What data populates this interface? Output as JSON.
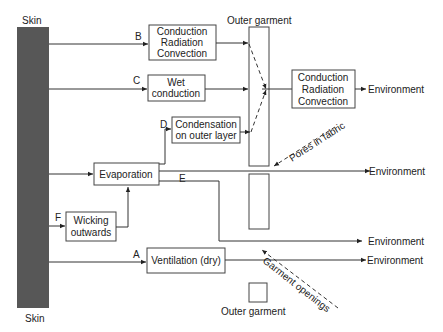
{
  "labels": {
    "skin_top": "Skin",
    "skin_bottom": "Skin",
    "outer_garment_top": "Outer garment",
    "outer_garment_bottom": "Outer garment",
    "pores": "Pores in fabric",
    "openings": "Garment openings"
  },
  "path_letters": {
    "a": "A",
    "b": "B",
    "c": "C",
    "d": "D",
    "e": "E",
    "f": "F"
  },
  "boxes": {
    "b": [
      "Conduction",
      "Radiation",
      "Convection"
    ],
    "c": [
      "Wet",
      "conduction"
    ],
    "d": [
      "Condensation",
      "on outer layer"
    ],
    "evap": [
      "Evaporation"
    ],
    "f": [
      "Wicking",
      "outwards"
    ],
    "a": [
      "Ventilation (dry)"
    ],
    "out": [
      "Conduction",
      "Radiation",
      "Convection"
    ]
  },
  "environment": [
    "Environment",
    "Environment",
    "Environment",
    "Environment"
  ],
  "colors": {
    "skin": "#575757",
    "line": "#333333"
  }
}
